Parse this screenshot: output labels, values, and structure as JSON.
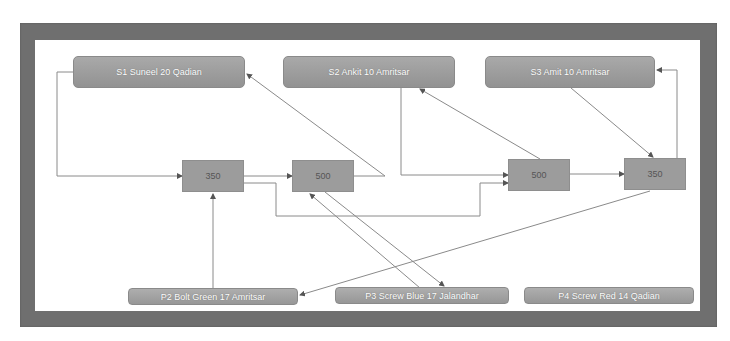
{
  "diagram": {
    "type": "flow-network",
    "sources": [
      {
        "id": "S1",
        "label": "S1 Suneel 20 Qadian"
      },
      {
        "id": "S2",
        "label": "S2 Ankit 10 Amritsar"
      },
      {
        "id": "S3",
        "label": "S3 Amit 10 Amritsar"
      }
    ],
    "process_nodes": [
      {
        "id": "N1",
        "label": "350"
      },
      {
        "id": "N2",
        "label": "500"
      },
      {
        "id": "N3",
        "label": "500"
      },
      {
        "id": "N4",
        "label": "350"
      }
    ],
    "products": [
      {
        "id": "P2",
        "label": "P2 Bolt Green 17 Amritsar"
      },
      {
        "id": "P3",
        "label": "P3 Screw Blue 17 Jalandhar"
      },
      {
        "id": "P4",
        "label": "P4 Screw Red 14 Qadian"
      }
    ],
    "edges": [
      {
        "from": "S1",
        "to": "N1"
      },
      {
        "from": "N1",
        "to": "N2"
      },
      {
        "from": "N2",
        "to": "S1"
      },
      {
        "from": "N1",
        "to": "N3"
      },
      {
        "from": "S2",
        "to": "N3"
      },
      {
        "from": "N3",
        "to": "S2"
      },
      {
        "from": "N3",
        "to": "N4"
      },
      {
        "from": "S3",
        "to": "N4"
      },
      {
        "from": "N4",
        "to": "S3"
      },
      {
        "from": "N4",
        "to": "P2"
      },
      {
        "from": "P2",
        "to": "N1"
      },
      {
        "from": "N2",
        "to": "P3"
      },
      {
        "from": "P3",
        "to": "N2"
      }
    ],
    "colors": {
      "frame": "#6f6f6f",
      "node_fill": "#9c9c9c",
      "edge": "#8a8a8a",
      "label_text": "#ffffff"
    }
  }
}
